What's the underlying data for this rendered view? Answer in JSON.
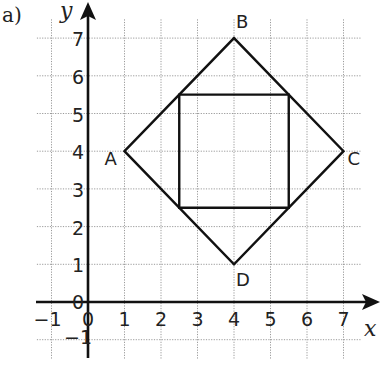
{
  "part_label": "a)",
  "axes": {
    "x_name": "x",
    "y_name": "y",
    "x_ticks": [
      "−1",
      "0",
      "1",
      "2",
      "3",
      "4",
      "5",
      "6",
      "7"
    ],
    "y_ticks": [
      "−1",
      "0",
      "1",
      "2",
      "3",
      "4",
      "5",
      "6",
      "7"
    ]
  },
  "vertices": [
    {
      "label": "A",
      "x": 1,
      "y": 4
    },
    {
      "label": "B",
      "x": 4,
      "y": 7
    },
    {
      "label": "C",
      "x": 7,
      "y": 4
    },
    {
      "label": "D",
      "x": 4,
      "y": 1
    }
  ],
  "inner_square": [
    [
      2.5,
      2.5
    ],
    [
      5.5,
      2.5
    ],
    [
      5.5,
      5.5
    ],
    [
      2.5,
      5.5
    ]
  ],
  "chart_data": {
    "type": "scatter",
    "title": "",
    "xlabel": "x",
    "ylabel": "y",
    "xlim": [
      -1,
      7
    ],
    "ylim": [
      -1,
      7
    ],
    "grid": true,
    "series": [
      {
        "name": "Square ABCD (rotated)",
        "points": [
          [
            1,
            4
          ],
          [
            4,
            7
          ],
          [
            7,
            4
          ],
          [
            4,
            1
          ]
        ],
        "labels": [
          "A",
          "B",
          "C",
          "D"
        ]
      },
      {
        "name": "Inner square",
        "points": [
          [
            2.5,
            2.5
          ],
          [
            5.5,
            2.5
          ],
          [
            5.5,
            5.5
          ],
          [
            2.5,
            5.5
          ]
        ]
      }
    ]
  }
}
